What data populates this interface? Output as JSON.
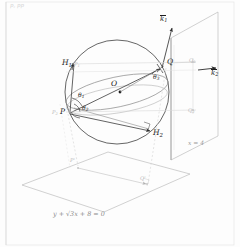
{
  "figure": {
    "title_corner": "p, pp",
    "sphere": {
      "center_label": "O",
      "center_cx": 117,
      "center_cy": 92,
      "radius": 52
    },
    "points": [
      {
        "name": "point-P",
        "label": "P",
        "x": 64,
        "y": 112,
        "sub": ""
      },
      {
        "name": "point-Q",
        "label": "Q",
        "x": 168,
        "y": 63,
        "sub": ""
      },
      {
        "name": "point-H1",
        "label": "H",
        "sub": "1",
        "x": 66,
        "y": 64
      },
      {
        "name": "point-H2",
        "label": "H",
        "sub": "2",
        "x": 155,
        "y": 133
      },
      {
        "name": "point-O",
        "label": "O",
        "sub": "",
        "x": 113,
        "y": 84
      }
    ],
    "angles": [
      {
        "name": "angle-theta1",
        "label": "θ",
        "sub": "1",
        "x": 80,
        "y": 96
      },
      {
        "name": "angle-theta2",
        "label": "θ",
        "sub": "2",
        "x": 84,
        "y": 109
      },
      {
        "name": "angle-theta3",
        "label": "θ",
        "sub": "3",
        "x": 155,
        "y": 78
      }
    ],
    "vectors": [
      {
        "name": "vector-k1",
        "label": "k",
        "sub": "1",
        "x": 163,
        "y": 20
      },
      {
        "name": "vector-k2",
        "label": "k",
        "sub": "2",
        "x": 213,
        "y": 73
      }
    ],
    "plane_labels": [
      {
        "name": "plane-label-x4",
        "label": "x = 4",
        "x": 190,
        "y": 144
      },
      {
        "name": "plane-label-equation",
        "label": "y + √3x + 8 = 0",
        "x": 55,
        "y": 215
      }
    ],
    "faint_labels": [
      {
        "name": "faint-label-P1",
        "label": "P",
        "sub": "1",
        "x": 75,
        "y": 66
      },
      {
        "name": "faint-label-Q1",
        "label": "Q",
        "sub": "1",
        "x": 191,
        "y": 63
      },
      {
        "name": "faint-label-P2",
        "label": "P",
        "sub": "2",
        "x": 53,
        "y": 114
      },
      {
        "name": "faint-label-Q2",
        "label": "Q",
        "sub": "2",
        "x": 190,
        "y": 112
      },
      {
        "name": "faint-label-Pproj",
        "label": "P'",
        "x": 70,
        "y": 162
      },
      {
        "name": "faint-label-Qproj",
        "label": "Q'",
        "x": 140,
        "y": 180
      }
    ],
    "colors": {
      "stroke": "#6e6e6e",
      "stroke_dark": "#2b2b2b",
      "stroke_faint": "#cfcfcf",
      "stroke_mid": "#a8a8a8",
      "background": "#fdfdfd",
      "border": "#e3e3e3"
    }
  }
}
